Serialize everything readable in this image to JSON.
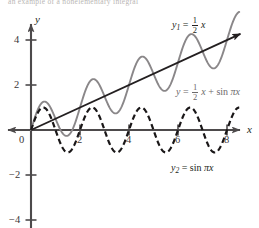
{
  "figure": {
    "top_cut_text": "an example of a nonelementary integral",
    "background_color": "#ffffff"
  },
  "axes": {
    "x_axis_name": "x",
    "y_axis_name": "y",
    "origin_label": "0",
    "x_ticks": [
      2,
      4,
      6,
      8
    ],
    "y_ticks": [
      4,
      2,
      -2,
      -4
    ],
    "x_tick_labels": [
      "2",
      "4",
      "6",
      "8"
    ],
    "y_tick_labels": [
      "4",
      "2",
      "−2",
      "−4"
    ],
    "x_range": [
      -1.2,
      9.3
    ],
    "y_range": [
      -4.6,
      4.9
    ],
    "origin_px": {
      "x": 31,
      "y": 130
    },
    "px_per_unit_x": 24.5,
    "px_per_unit_y": 22.5
  },
  "labels": {
    "line_label": {
      "name": "y1",
      "sub": "1",
      "num": "1",
      "den": "2",
      "var": "x"
    },
    "sum_label": {
      "name": "y",
      "num": "1",
      "den": "2",
      "var": "x",
      "plus": "+",
      "fn": "sin",
      "arg": "πx"
    },
    "sine_label": {
      "name": "y2",
      "sub": "2",
      "fn": "sin",
      "arg": "πx"
    }
  },
  "colors": {
    "axis": "#4d4a4b",
    "line_curve": "#231f20",
    "sine_curve": "#1a1718",
    "sum_curve": "#8a8789",
    "tick_text": "#3a3637",
    "label_text": "#231f20",
    "sum_label_text": "#6d6a6b"
  },
  "chart_data": {
    "type": "line",
    "title": "",
    "xlabel": "x",
    "ylabel": "y",
    "xlim": [
      -1.2,
      9.3
    ],
    "ylim": [
      -4.6,
      4.9
    ],
    "grid": false,
    "legend": "inline-annotations",
    "x_ticks": [
      2,
      4,
      6,
      8
    ],
    "y_ticks": [
      -4,
      -2,
      2,
      4
    ],
    "series": [
      {
        "name": "y1 = (1/2)x",
        "style": "solid",
        "color": "#231f20",
        "formula": "0.5*x",
        "domain": [
          0,
          8.55
        ],
        "annotation": "y1 = 1/2 x",
        "annotation_at": [
          7.2,
          4.45
        ],
        "sample_points": [
          {
            "x": 0,
            "y": 0
          },
          {
            "x": 1,
            "y": 0.5
          },
          {
            "x": 2,
            "y": 1
          },
          {
            "x": 3,
            "y": 1.5
          },
          {
            "x": 4,
            "y": 2
          },
          {
            "x": 5,
            "y": 2.5
          },
          {
            "x": 6,
            "y": 3
          },
          {
            "x": 7,
            "y": 3.5
          },
          {
            "x": 8,
            "y": 4
          },
          {
            "x": 8.55,
            "y": 4.275
          }
        ]
      },
      {
        "name": "y2 = sin pi x",
        "style": "dashed",
        "color": "#1a1718",
        "formula": "sin(pi*x)",
        "domain": [
          0,
          8.5
        ],
        "annotation": "y2 = sin pi x",
        "annotation_at": [
          6.4,
          -1.75
        ],
        "amplitude": 1,
        "period": 2,
        "sample_points": [
          {
            "x": 0,
            "y": 0
          },
          {
            "x": 0.5,
            "y": 1
          },
          {
            "x": 1,
            "y": 0
          },
          {
            "x": 1.5,
            "y": -1
          },
          {
            "x": 2,
            "y": 0
          },
          {
            "x": 2.5,
            "y": 1
          },
          {
            "x": 3,
            "y": 0
          },
          {
            "x": 3.5,
            "y": -1
          },
          {
            "x": 4,
            "y": 0
          },
          {
            "x": 4.5,
            "y": 1
          },
          {
            "x": 5,
            "y": 0
          },
          {
            "x": 5.5,
            "y": -1
          },
          {
            "x": 6,
            "y": 0
          },
          {
            "x": 6.5,
            "y": 1
          },
          {
            "x": 7,
            "y": 0
          },
          {
            "x": 7.5,
            "y": -1
          },
          {
            "x": 8,
            "y": 0
          },
          {
            "x": 8.5,
            "y": 1
          }
        ]
      },
      {
        "name": "y = (1/2)x + sin pi x",
        "style": "solid",
        "color": "#8a8789",
        "formula": "0.5*x + sin(pi*x)",
        "domain": [
          0,
          8.5
        ],
        "annotation": "y = 1/2 x + sin pi x",
        "annotation_at": [
          5.6,
          2.05
        ],
        "sample_points": [
          {
            "x": 0,
            "y": 0
          },
          {
            "x": 0.5,
            "y": 1.25
          },
          {
            "x": 1,
            "y": 0.5
          },
          {
            "x": 1.5,
            "y": -0.25
          },
          {
            "x": 2,
            "y": 1
          },
          {
            "x": 2.5,
            "y": 2.25
          },
          {
            "x": 3,
            "y": 1.5
          },
          {
            "x": 3.5,
            "y": 0.75
          },
          {
            "x": 4,
            "y": 2
          },
          {
            "x": 4.5,
            "y": 3.25
          },
          {
            "x": 5,
            "y": 2.5
          },
          {
            "x": 5.5,
            "y": 1.75
          },
          {
            "x": 6,
            "y": 3
          },
          {
            "x": 6.5,
            "y": 4.25
          },
          {
            "x": 7,
            "y": 3.5
          },
          {
            "x": 7.5,
            "y": 2.75
          },
          {
            "x": 8,
            "y": 4
          },
          {
            "x": 8.5,
            "y": 5.25
          }
        ]
      }
    ]
  }
}
